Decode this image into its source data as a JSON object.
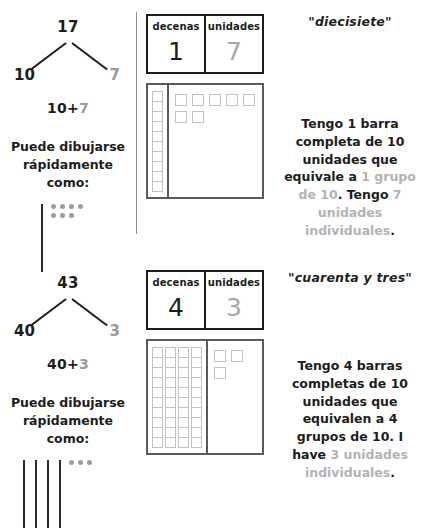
{
  "sections": [
    {
      "id": "seventeen",
      "bond": {
        "whole": "17",
        "tens_part": "10",
        "ones_part": "7"
      },
      "equation": {
        "tens": "10",
        "plus": "+",
        "ones": "7"
      },
      "draw_prompt": "Puede dibujarse rápidamente como:",
      "quick_draw": {
        "stick_count": 1,
        "dot_count": 7
      },
      "place_value_table": {
        "headers": [
          "decenas",
          "unidades"
        ],
        "values": [
          "1",
          "7"
        ]
      },
      "blocks": {
        "ten_bars": 1,
        "units_per_bar": 10,
        "loose_units": 7
      },
      "word_label": "\"diecisiete\"",
      "explanation": {
        "parts": [
          {
            "text": "Tengo 1 barra completa de 10 unidades que equivale a ",
            "color": "black"
          },
          {
            "text": "1 grupo de 10",
            "color": "gray"
          },
          {
            "text": ". Tengo ",
            "color": "black"
          },
          {
            "text": "7 unidades individuales",
            "color": "gray"
          },
          {
            "text": ".",
            "color": "black"
          }
        ]
      }
    },
    {
      "id": "forty-three",
      "bond": {
        "whole": "43",
        "tens_part": "40",
        "ones_part": "3"
      },
      "equation": {
        "tens": "40",
        "plus": "+",
        "ones": "3"
      },
      "draw_prompt": "Puede dibujarse rápidamente como:",
      "quick_draw": {
        "stick_count": 4,
        "dot_count": 3
      },
      "place_value_table": {
        "headers": [
          "decenas",
          "unidades"
        ],
        "values": [
          "4",
          "3"
        ]
      },
      "blocks": {
        "ten_bars": 4,
        "units_per_bar": 10,
        "loose_units": 3
      },
      "word_label": "\"cuarenta y tres\"",
      "explanation": {
        "parts": [
          {
            "text": "Tengo 4 barras completas de 10 unidades que equivalen a 4 grupos de 10. I have ",
            "color": "black"
          },
          {
            "text": "3 unidades individuales",
            "color": "gray"
          },
          {
            "text": ".",
            "color": "black"
          }
        ]
      }
    }
  ],
  "colors": {
    "tens": "#1d1d1d",
    "ones": "#9a9a9a",
    "block_outline": "#c2c2c2",
    "box_border": "#5a5a5a"
  }
}
